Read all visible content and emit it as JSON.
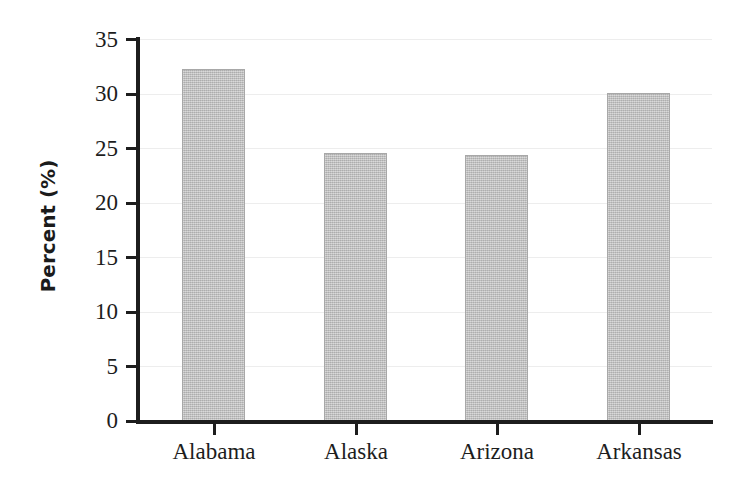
{
  "chart_data": {
    "type": "bar",
    "title": "",
    "subtitle": "",
    "xlabel": "",
    "ylabel": "Percent (%)",
    "categories": [
      "Alabama",
      "Alaska",
      "Arizona",
      "Arkansas"
    ],
    "values": [
      32.3,
      24.6,
      24.4,
      30.1
    ],
    "series": [
      {
        "name": "Percent",
        "values": [
          32.3,
          24.6,
          24.4,
          30.1
        ]
      }
    ],
    "ylim": [
      0,
      35
    ],
    "xlim_categories": 4,
    "y_ticks": [
      0,
      5,
      10,
      15,
      20,
      25,
      30,
      35
    ],
    "y_tick_labels": [
      "0",
      "5",
      "10",
      "15",
      "20",
      "25",
      "30",
      "35"
    ],
    "grid": true,
    "grid_axis": "y",
    "legend": false,
    "legend_position": "none",
    "bar_color": "#b9b9b9",
    "bar_edge_color": "#a8a8a8",
    "axis_color": "#1d1d1d",
    "grid_color": "#ededed",
    "background_color": "#ffffff",
    "annotations": []
  },
  "axis": {
    "y_title": "Percent (%)"
  }
}
